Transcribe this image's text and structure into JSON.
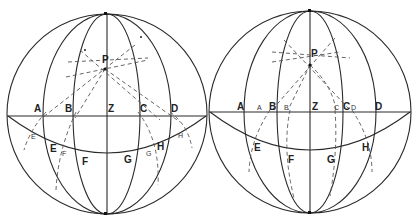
{
  "figure": {
    "left": {
      "pole_label": "P",
      "equator_labels": [
        "A",
        "B",
        "Z",
        "C",
        "D"
      ],
      "parallel_labels": [
        "E",
        "F",
        "G",
        "H"
      ],
      "small_labels": [
        "E",
        "F",
        "G",
        "H"
      ]
    },
    "right": {
      "pole_label": "P",
      "equator_labels": [
        "A",
        "B",
        "Z",
        "C",
        "D"
      ],
      "small_labels": [
        "A",
        "B",
        "C",
        "D"
      ],
      "parallel_labels": [
        "E",
        "F",
        "G",
        "H"
      ]
    }
  }
}
